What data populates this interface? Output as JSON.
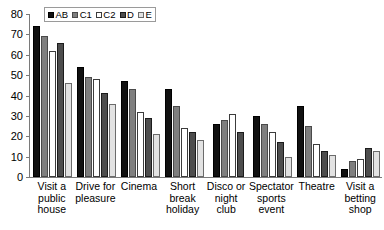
{
  "chart_data": {
    "type": "bar",
    "title": "",
    "subtitle": "",
    "xlabel": "",
    "ylabel": "",
    "ylim": [
      0,
      80
    ],
    "yticks": [
      0,
      10,
      20,
      30,
      40,
      50,
      60,
      70,
      80
    ],
    "grid": false,
    "legend_position": "top-left",
    "categories": [
      "Visit a public house",
      "Drive for pleasure",
      "Cinema",
      "Short break holiday",
      "Disco or night club",
      "Spectator sports event",
      "Theatre",
      "Visit a betting shop"
    ],
    "category_lines": [
      [
        "Visit a",
        "public",
        "house"
      ],
      [
        "Drive for",
        "pleasure"
      ],
      [
        "Cinema"
      ],
      [
        "Short",
        "break",
        "holiday"
      ],
      [
        "Disco or",
        "night club"
      ],
      [
        "Spectator",
        "sports",
        "event"
      ],
      [
        "Theatre"
      ],
      [
        "Visit a",
        "betting",
        "shop"
      ]
    ],
    "series": [
      {
        "name": "AB",
        "color": "#111111",
        "values": [
          74,
          54,
          47,
          43,
          26,
          30,
          35,
          4
        ]
      },
      {
        "name": "C1",
        "color": "#7f7f7f",
        "values": [
          69,
          49,
          43,
          35,
          28,
          26,
          25,
          8
        ]
      },
      {
        "name": "C2",
        "color": "#ffffff",
        "values": [
          62,
          48,
          32,
          24,
          31,
          22,
          16,
          9
        ]
      },
      {
        "name": "D",
        "color": "#4d4d4d",
        "values": [
          66,
          41,
          29,
          22,
          22,
          17,
          13,
          14
        ]
      },
      {
        "name": "E",
        "color": "#e2e2e2",
        "values": [
          46,
          36,
          21,
          18,
          0,
          10,
          11,
          13
        ]
      }
    ]
  },
  "legend": {
    "items": [
      {
        "label": "AB"
      },
      {
        "label": "C1"
      },
      {
        "label": "C2"
      },
      {
        "label": "D"
      },
      {
        "label": "E"
      }
    ]
  }
}
